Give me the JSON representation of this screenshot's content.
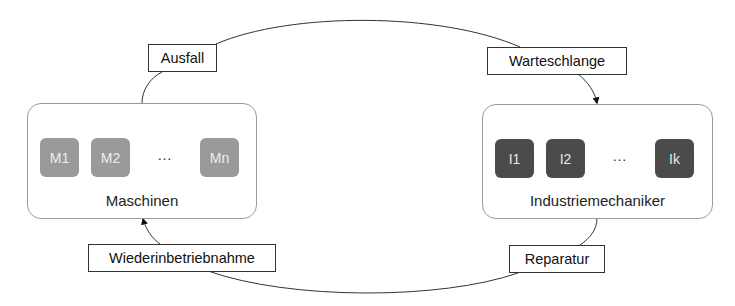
{
  "diagram": {
    "groups": {
      "machines": {
        "title": "Maschinen",
        "units": [
          "M1",
          "M2",
          "Mn"
        ],
        "ellipsis": "…",
        "unit_color": "#9a9a9a"
      },
      "mechanics": {
        "title": "Industriemechaniker",
        "units": [
          "I1",
          "I2",
          "Ik"
        ],
        "ellipsis": "…",
        "unit_color": "#4b4b4b"
      }
    },
    "transitions": {
      "failure": "Ausfall",
      "queue": "Warteschlange",
      "repair": "Reparatur",
      "recommission": "Wiederinbetriebnahme"
    },
    "flow": [
      {
        "from": "Maschinen",
        "via": "Ausfall"
      },
      {
        "from": "Ausfall",
        "via": "Warteschlange",
        "to": "Industriemechaniker"
      },
      {
        "from": "Industriemechaniker",
        "via": "Reparatur"
      },
      {
        "from": "Reparatur",
        "via": "Wiederinbetriebnahme",
        "to": "Maschinen"
      }
    ]
  }
}
